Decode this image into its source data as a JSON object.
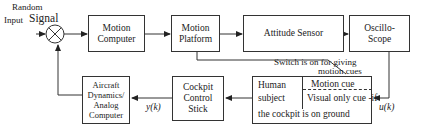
{
  "diagram": {
    "input": {
      "line1": "Random",
      "line2a": "Input",
      "line2b": "Signal"
    },
    "blocks": {
      "motion_computer": {
        "line1": "Motion",
        "line2": "Computer"
      },
      "motion_platform": {
        "line1": "Motion",
        "line2": "Platform"
      },
      "attitude_sensor": {
        "line1": "Attitude Sensor"
      },
      "oscilloscope": {
        "line1": "Oscillo-",
        "line2": "Scope"
      },
      "human_subject": {
        "left1": "Human",
        "left2": "subject",
        "right1": "Motion cue",
        "right2": "Visual only cue -if",
        "bottom": "the cockpit is on ground"
      },
      "cockpit_stick": {
        "line1": "Cockpit",
        "line2": "Control",
        "line3": "Stick"
      },
      "aircraft": {
        "line1": "Aircraft",
        "line2": "Dynamics/",
        "line3": "Analog",
        "line4": "Computer"
      }
    },
    "switch_note": {
      "line1": "Switch is on for giving",
      "line2": "motion cues"
    },
    "signals": {
      "u": "u(k)",
      "y": "y(k)"
    },
    "colors": {
      "line": "#333333",
      "background": "#ffffff"
    }
  }
}
